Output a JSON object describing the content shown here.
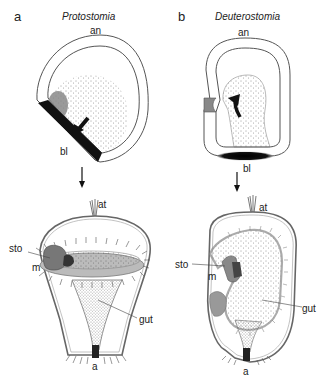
{
  "panels": [
    {
      "letter": "a",
      "title": "Protostomia",
      "labels": {
        "animal_pole": "an",
        "blastopore": "bl",
        "apical_tuft": "at",
        "stomodeum": "sto",
        "mouth": "m",
        "gut": "gut",
        "anus": "a"
      }
    },
    {
      "letter": "b",
      "title": "Deuterostomia",
      "labels": {
        "animal_pole": "an",
        "blastopore": "bl",
        "apical_tuft": "at",
        "stomodeum": "sto",
        "mouth": "m",
        "gut": "gut",
        "anus": "a"
      }
    }
  ],
  "colors": {
    "outline": "#555555",
    "blastopore_fill": "#111111",
    "mouth_fill": "#777777",
    "stomodeum_fill": "#999999",
    "stipple": "#333333"
  }
}
